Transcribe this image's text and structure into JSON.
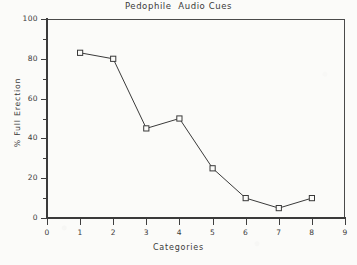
{
  "chart_data": {
    "type": "line",
    "title": "Pedophile  Audio Cues",
    "xlabel": "Categories",
    "ylabel": "% Full Erection",
    "x": [
      1,
      2,
      3,
      4,
      5,
      6,
      7,
      8
    ],
    "values": [
      83,
      80,
      45,
      50,
      25,
      10,
      5,
      10
    ],
    "categories": [
      "1",
      "2",
      "3",
      "4",
      "5",
      "6",
      "7",
      "8"
    ],
    "series": [
      {
        "name": "% Full Erection",
        "values": [
          83,
          80,
          45,
          50,
          25,
          10,
          5,
          10
        ]
      }
    ],
    "xlim": [
      0,
      9
    ],
    "ylim": [
      0,
      100
    ],
    "xticks": [
      "0",
      "1",
      "2",
      "3",
      "4",
      "5",
      "6",
      "7",
      "8",
      "9"
    ],
    "yticks": [
      "0",
      "20",
      "40",
      "60",
      "80",
      "100"
    ],
    "y_minor_ticks": [
      10,
      30,
      50,
      70,
      90
    ],
    "grid": false,
    "legend": null,
    "marker": "open-square",
    "line_color": "#3a3a3a",
    "marker_fill": "#fbfbf9",
    "background_color": "#fbfbf9"
  }
}
